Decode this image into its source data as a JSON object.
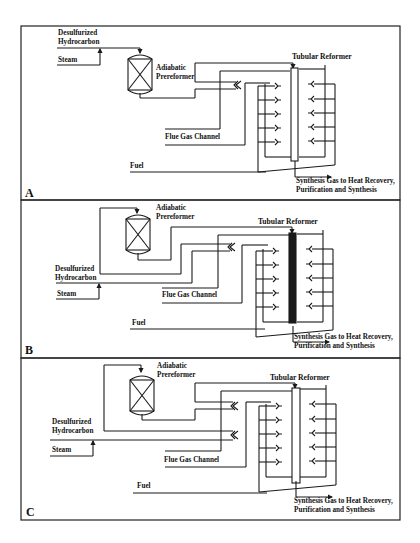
{
  "figure": {
    "panels": [
      {
        "letter": "A",
        "labels": {
          "hydrocarbon_1": "Desulfurized",
          "hydrocarbon_2": "Hydrocarbon",
          "steam": "Steam",
          "preformer_1": "Adiabatic",
          "preformer_2": "Prereformer",
          "reformer": "Tubular Reformer",
          "flue": "Flue Gas Channel",
          "fuel": "Fuel",
          "syngas_1": "Synthesis Gas to Heat Recovery,",
          "syngas_2": "Purification and Synthesis"
        },
        "tube_fill": "#ffffff"
      },
      {
        "letter": "B",
        "labels": {
          "hydrocarbon_1": "Desulfurized",
          "hydrocarbon_2": "Hydrocarbon",
          "steam": "Steam",
          "preformer_1": "Adiabatic",
          "preformer_2": "Prereformer",
          "reformer": "Tubular Reformer",
          "flue": "Flue Gas Channel",
          "fuel": "Fuel",
          "syngas_1": "Synthesis Gas to Heat Recovery,",
          "syngas_2": "Purification and Synthesis"
        },
        "tube_fill": "#1a1a1a"
      },
      {
        "letter": "C",
        "labels": {
          "hydrocarbon_1": "Desulfurized",
          "hydrocarbon_2": "Hydrocarbon",
          "steam": "Steam",
          "preformer_1": "Adiabatic",
          "preformer_2": "Prereformer",
          "reformer": "Tubular Reformer",
          "flue": "Flue Gas Channel",
          "fuel": "Fuel",
          "syngas_1": "Synthesis Gas to Heat Recovery,",
          "syngas_2": "Purification and Synthesis"
        },
        "tube_fill": "#ffffff"
      }
    ]
  }
}
